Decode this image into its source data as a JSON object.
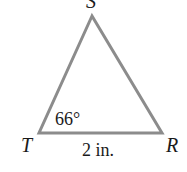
{
  "diagram": {
    "type": "triangle",
    "vertices": [
      {
        "name": "S",
        "label": "S"
      },
      {
        "name": "T",
        "label": "T"
      },
      {
        "name": "R",
        "label": "R"
      }
    ],
    "angle_label": "66°",
    "angle_at": "T",
    "side_label": "2 in.",
    "side": "TR",
    "stroke_color": "#8c8c8c"
  }
}
